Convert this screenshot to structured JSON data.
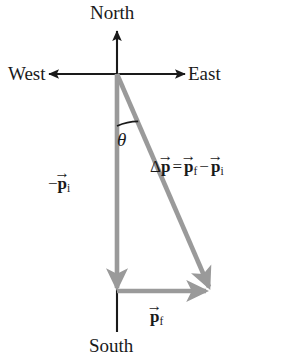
{
  "figure": {
    "type": "vector-diagram",
    "background_color": "#ffffff",
    "axis_color": "#1a1a1a",
    "vector_color": "#9a9a9a",
    "text_color": "#1a1a1a"
  },
  "cropped_text": {
    "top_fragment": "ath."
  },
  "compass": {
    "north": "North",
    "south": "South",
    "west": "West",
    "east": "East"
  },
  "angle": {
    "symbol": "θ"
  },
  "labels": {
    "delta_p": {
      "delta": "Δ",
      "p": "p",
      "hat": "→",
      "equals": "=",
      "p_final": "p",
      "sub_final": "f",
      "minus": "−",
      "p_initial": "p",
      "sub_initial": "i",
      "plain_text": "Δp⃗ = p⃗f − p⃗i"
    },
    "neg_p_i": {
      "minus": "−",
      "p": "p",
      "hat": "→",
      "sub": "i",
      "plain_text": "−p⃗i"
    },
    "p_f": {
      "p": "p",
      "hat": "→",
      "sub": "f",
      "plain_text": "p⃗f"
    }
  },
  "geometry": {
    "origin": {
      "x": 117,
      "y": 74
    },
    "north_tip": {
      "x": 117,
      "y": 30
    },
    "south_end": {
      "x": 117,
      "y": 332
    },
    "west_tip": {
      "x": 48,
      "y": 74
    },
    "east_tip": {
      "x": 186,
      "y": 74
    },
    "neg_p_i_vector": {
      "from": {
        "x": 117,
        "y": 74
      },
      "to": {
        "x": 117,
        "y": 295
      }
    },
    "delta_p_vector": {
      "from": {
        "x": 117,
        "y": 74
      },
      "to": {
        "x": 213,
        "y": 296
      }
    },
    "p_f_vector": {
      "from": {
        "x": 117,
        "y": 290
      },
      "to": {
        "x": 213,
        "y": 290
      }
    },
    "angle_arc": {
      "center": {
        "x": 117,
        "y": 74
      },
      "radius": 52,
      "from_deg": 90,
      "to_deg": 66
    }
  }
}
